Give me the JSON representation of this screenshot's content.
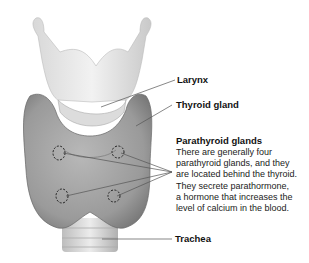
{
  "labels": {
    "larynx": "Larynx",
    "thyroid": "Thyroid gland",
    "parathyroid": "Parathyroid glands",
    "trachea": "Trachea"
  },
  "parathyroid_description": [
    "There are generally four",
    "parathyroid glands, and they",
    "are located behind the thyroid.",
    "They secrete parathormone,",
    "a hormone that increases the",
    "level of calcium in the blood."
  ],
  "colors": {
    "leader_line": "#555555",
    "text": "#111111",
    "tissue": "#8f8f8f",
    "cartilage": "#e4e4e4"
  }
}
